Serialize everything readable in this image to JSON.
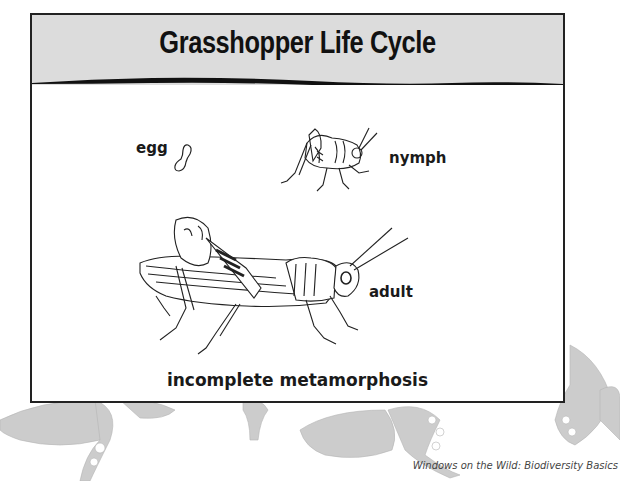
{
  "diagram": {
    "title": "Grasshopper Life Cycle",
    "stages": [
      {
        "id": "egg",
        "label": "egg"
      },
      {
        "id": "nymph",
        "label": "nymph"
      },
      {
        "id": "adult",
        "label": "adult"
      }
    ],
    "caption": "incomplete metamorphosis"
  },
  "footer": {
    "credit": "Windows on the Wild: Biodiversity Basics"
  },
  "colors": {
    "header_bg": "#dcdcdc",
    "border": "#222222",
    "butterfly_gray": "#b8b8b8"
  },
  "icons": [
    "egg-illustration",
    "nymph-grasshopper-illustration",
    "adult-grasshopper-illustration",
    "butterfly-watermark"
  ]
}
